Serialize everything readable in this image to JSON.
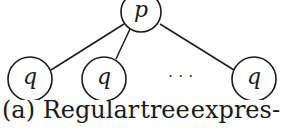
{
  "diagram": {
    "root": {
      "label": "p",
      "cx": 141,
      "cy": 12,
      "r": 20
    },
    "children": [
      {
        "label": "q",
        "cx": 30,
        "cy": 79,
        "r": 22
      },
      {
        "label": "q",
        "cx": 104,
        "cy": 79,
        "r": 22
      },
      {
        "label": "q",
        "cx": 254,
        "cy": 79,
        "r": 22
      }
    ],
    "ellipsis": "· · ·",
    "edges": [
      {
        "x1": 124,
        "y1": 24,
        "x2": 51,
        "y2": 70
      },
      {
        "x1": 130,
        "y1": 29,
        "x2": 116,
        "y2": 59
      },
      {
        "x1": 160,
        "y1": 24,
        "x2": 234,
        "y2": 70
      }
    ]
  },
  "caption": {
    "parts": [
      "(a) Regular",
      "tree",
      "expres-"
    ]
  }
}
